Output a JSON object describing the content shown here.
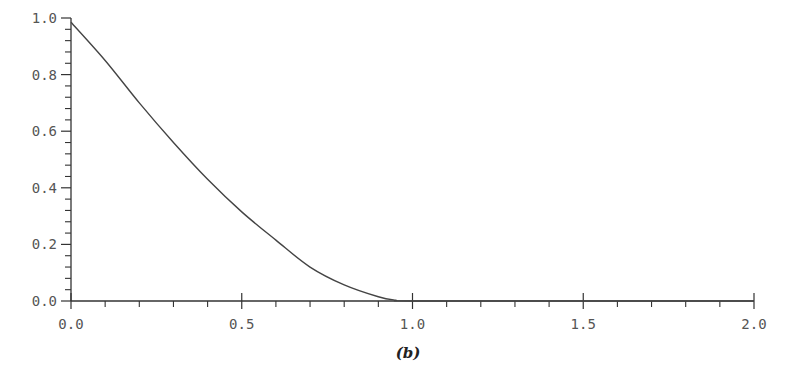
{
  "chart_data": {
    "type": "line",
    "title": "",
    "caption": "(b)",
    "xlabel": "",
    "ylabel": "",
    "xlim": [
      0.0,
      2.0
    ],
    "ylim": [
      0.0,
      1.0
    ],
    "grid": false,
    "legend": null,
    "x_major_ticks": [
      0.0,
      0.5,
      1.0,
      1.5,
      2.0
    ],
    "x_tick_labels": [
      "0.0",
      "0.5",
      "1.0",
      "1.5",
      "2.0"
    ],
    "x_minor_step": 0.1,
    "y_major_ticks": [
      0.0,
      0.2,
      0.4,
      0.6,
      0.8,
      1.0
    ],
    "y_tick_labels": [
      "0.0",
      "0.2",
      "0.4",
      "0.6",
      "0.8",
      "1.0"
    ],
    "y_minor_step": 0.04,
    "series": [
      {
        "name": "curve",
        "color": "#444444",
        "x": [
          0.0,
          0.1,
          0.2,
          0.3,
          0.4,
          0.5,
          0.6,
          0.7,
          0.8,
          0.9,
          0.95,
          1.0,
          1.5,
          2.0
        ],
        "y": [
          0.985,
          0.85,
          0.7,
          0.56,
          0.43,
          0.315,
          0.215,
          0.12,
          0.057,
          0.015,
          0.003,
          0.0,
          0.0,
          0.0
        ]
      }
    ]
  }
}
